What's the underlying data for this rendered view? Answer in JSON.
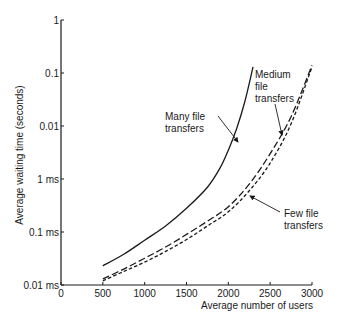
{
  "chart_data": {
    "type": "line",
    "title": "",
    "xlabel": "Average number of users",
    "ylabel": "Average waiting time (seconds)",
    "xlim": [
      0,
      3000
    ],
    "ylim": [
      1e-05,
      1
    ],
    "yscale": "log",
    "grid": false,
    "legend_position": "inline annotations",
    "x_ticks": [
      0,
      500,
      1000,
      1500,
      2000,
      2500,
      3000
    ],
    "x_tick_labels": [
      "0",
      "500",
      "1000",
      "1500",
      "2000",
      "2500",
      "3000"
    ],
    "y_ticks": [
      1e-05,
      0.0001,
      0.001,
      0.01,
      0.1,
      1
    ],
    "y_tick_labels": [
      "0.01 ms",
      "0.1 ms",
      "1 ms",
      "0.01",
      "0.1",
      "1"
    ],
    "series": [
      {
        "name": "Many file transfers",
        "style": "solid",
        "x": [
          500,
          750,
          1000,
          1250,
          1500,
          1750,
          1900,
          2000,
          2100,
          2200,
          2295
        ],
        "y": [
          2.3e-05,
          3.8e-05,
          7e-05,
          0.00013,
          0.00028,
          0.0007,
          0.0016,
          0.0035,
          0.009,
          0.03,
          0.13
        ]
      },
      {
        "name": "Medium file transfers",
        "style": "dashed",
        "x": [
          500,
          750,
          1000,
          1250,
          1500,
          1750,
          2000,
          2250,
          2500,
          2750,
          3000
        ],
        "y": [
          1.3e-05,
          2e-05,
          3.2e-05,
          5.2e-05,
          9e-05,
          0.00016,
          0.0003,
          0.0008,
          0.003,
          0.015,
          0.14
        ]
      },
      {
        "name": "Few file transfers",
        "style": "short-dashed",
        "x": [
          500,
          750,
          1000,
          1250,
          1500,
          1750,
          2000,
          2250,
          2500,
          2750,
          3000
        ],
        "y": [
          1.2e-05,
          1.8e-05,
          2.7e-05,
          4.3e-05,
          7.2e-05,
          0.00013,
          0.00024,
          0.0006,
          0.002,
          0.011,
          0.13
        ]
      }
    ],
    "annotations": [
      {
        "text": [
          "Many file",
          "transfers"
        ],
        "points_to": "Many file transfers"
      },
      {
        "text": [
          "Medium",
          "file",
          "transfers"
        ],
        "points_to": "Medium file transfers"
      },
      {
        "text": [
          "Few file",
          "transfers"
        ],
        "points_to": "Few file transfers"
      }
    ]
  },
  "colors": {
    "line": "#1a1a1a",
    "axis": "#1a1a1a",
    "background": "#ffffff"
  }
}
